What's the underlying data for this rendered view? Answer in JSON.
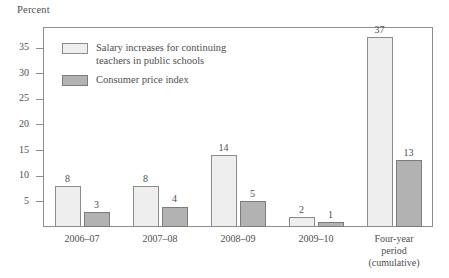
{
  "chart_data": {
    "type": "bar",
    "title": "",
    "xlabel": "",
    "ylabel": "Percent",
    "ylim": [
      0,
      39
    ],
    "yticks": [
      5,
      10,
      15,
      20,
      25,
      30,
      35
    ],
    "grid": false,
    "legend_position": "top-left",
    "categories": [
      "2006–07",
      "2007–08",
      "2008–09",
      "2009–10",
      "Four-year period (cumulative)"
    ],
    "category_lines": [
      [
        "2006–07"
      ],
      [
        "2007–08"
      ],
      [
        "2008–09"
      ],
      [
        "2009–10"
      ],
      [
        "Four-year",
        "period",
        "(cumulative)"
      ]
    ],
    "series": [
      {
        "name": "Salary increases for continuing teachers in public schools",
        "name_lines": [
          "Salary increases for continuing",
          "teachers in public schools"
        ],
        "color": "#eeeeee",
        "values": [
          8,
          8,
          14,
          2,
          37
        ]
      },
      {
        "name": "Consumer price index",
        "name_lines": [
          "Consumer price index"
        ],
        "color": "#b2b2b2",
        "values": [
          3,
          4,
          5,
          1,
          13
        ]
      }
    ]
  },
  "colors": {
    "series_light": "#eeeeee",
    "series_dark": "#b2b2b2",
    "axis": "#8e8e90",
    "text": "#4e4e50"
  }
}
